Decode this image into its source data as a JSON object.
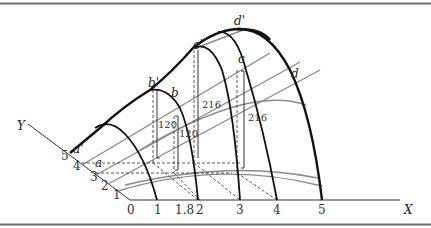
{
  "figure": {
    "type": "3d-surface-diagram",
    "colors": {
      "border": "#707070",
      "axis": "#333333",
      "curve_black": "#111111",
      "curve_gray": "#8a8a8a",
      "dashed": "#444444"
    },
    "x_axis": {
      "label": "X",
      "ticks": [
        "0",
        "1",
        "1.8",
        "2",
        "3",
        "4",
        "5"
      ]
    },
    "y_axis": {
      "label": "Y",
      "ticks": [
        "1",
        "2",
        "3",
        "4",
        "5"
      ]
    },
    "points": {
      "a": "a",
      "a_prime": "a'",
      "b": "b",
      "b_prime": "b'",
      "c": "c",
      "c_prime": "c'",
      "d": "d",
      "d_prime": "d'"
    },
    "heights": {
      "b_prime_height": "120",
      "b_height": "120",
      "c_prime_height": "216",
      "c_height": "216"
    }
  }
}
